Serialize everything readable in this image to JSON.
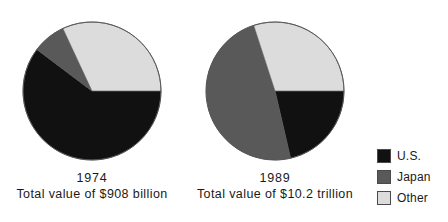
{
  "chart_data": {
    "type": "pie",
    "title": "",
    "subtitle": "",
    "legend_position": "right",
    "colors": {
      "us": "#111111",
      "japan": "#595959",
      "other": "#dcdcdc",
      "outline": "#555555",
      "background": "#ffffff"
    },
    "legend": [
      {
        "key": "us",
        "label": "U.S.",
        "color": "#111111"
      },
      {
        "key": "japan",
        "label": "Japan",
        "color": "#595959"
      },
      {
        "key": "other",
        "label": "Other",
        "color": "#dcdcdc"
      }
    ],
    "charts": [
      {
        "id": "pie-1974",
        "year": "1974",
        "total_caption": "Total value of $908 billion",
        "total_value": "$908 billion",
        "categories": [
          "U.S.",
          "Japan",
          "Other"
        ],
        "values": [
          60,
          8,
          32
        ],
        "slices": [
          {
            "label": "U.S.",
            "key": "us",
            "percent": 60,
            "start_deg": 143,
            "end_deg": 360,
            "color": "#111111"
          },
          {
            "label": "Japan",
            "key": "japan",
            "percent": 8,
            "start_deg": 115,
            "end_deg": 143,
            "color": "#595959"
          },
          {
            "label": "Other",
            "key": "other",
            "percent": 32,
            "start_deg": 0,
            "end_deg": 115,
            "color": "#dcdcdc"
          }
        ]
      },
      {
        "id": "pie-1989",
        "year": "1989",
        "total_caption": "Total value of $10.2 trillion",
        "total_value": "$10.2 trillion",
        "categories": [
          "U.S.",
          "Japan",
          "Other"
        ],
        "values": [
          38,
          32,
          30
        ],
        "slices": [
          {
            "label": "U.S.",
            "key": "us",
            "percent": 38,
            "start_deg": 283,
            "end_deg": 360,
            "color": "#111111"
          },
          {
            "label": "Japan",
            "key": "japan",
            "percent": 32,
            "start_deg": 108,
            "end_deg": 283,
            "color": "#595959"
          },
          {
            "label": "Other",
            "key": "other",
            "percent": 30,
            "start_deg": 0,
            "end_deg": 108,
            "color": "#dcdcdc"
          }
        ]
      }
    ]
  }
}
